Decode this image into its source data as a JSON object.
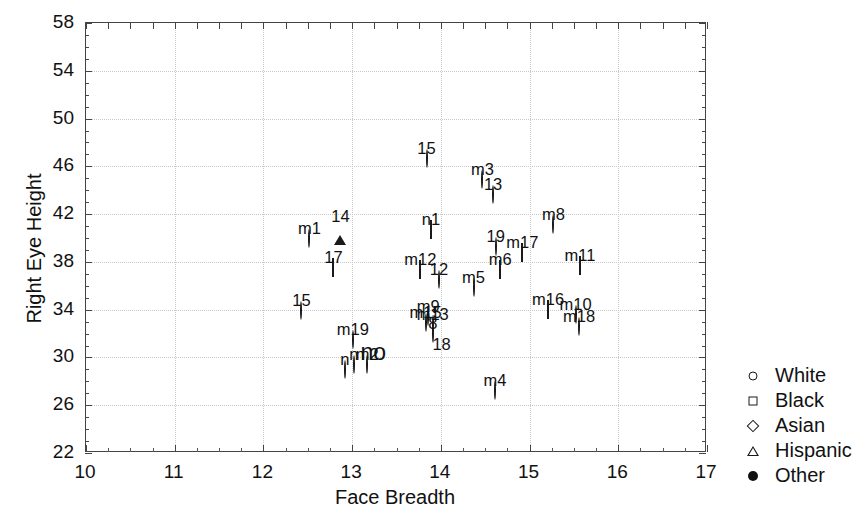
{
  "chart_data": {
    "type": "scatter",
    "title": "",
    "xlabel": "Face Breadth",
    "ylabel": "Right Eye Height",
    "xlim": [
      10,
      17
    ],
    "ylim": [
      22,
      58
    ],
    "xticks": [
      10,
      11,
      12,
      13,
      14,
      15,
      16,
      17
    ],
    "yticks": [
      22,
      26,
      30,
      34,
      38,
      42,
      46,
      50,
      54,
      58
    ],
    "grid": true,
    "legend_position": "right-outside",
    "legend": [
      {
        "label": "White",
        "marker": "open-circle"
      },
      {
        "label": "Black",
        "marker": "open-square"
      },
      {
        "label": "Asian",
        "marker": "open-diamond"
      },
      {
        "label": "Hispanic",
        "marker": "open-triangle"
      },
      {
        "label": "Other",
        "marker": "filled-circle"
      }
    ],
    "annotations": [
      {
        "text": "no",
        "x": 13.25,
        "y": 30.2
      }
    ],
    "points": [
      {
        "label": "15",
        "group": "White",
        "marker": "open-circle",
        "x": 13.85,
        "y": 46.5
      },
      {
        "label": "m3",
        "group": "White",
        "marker": "open-circle",
        "x": 14.48,
        "y": 44.8
      },
      {
        "label": "13",
        "group": "White",
        "marker": "open-circle",
        "x": 14.6,
        "y": 43.5
      },
      {
        "label": "m8",
        "group": "White",
        "marker": "open-circle",
        "x": 15.28,
        "y": 41.0
      },
      {
        "label": "14",
        "group": "Hispanic",
        "marker": "open-triangle",
        "x": 12.88,
        "y": 40.8
      },
      {
        "label": "n1",
        "group": "Asian",
        "marker": "open-diamond",
        "x": 13.9,
        "y": 40.6
      },
      {
        "label": "m1",
        "group": "White",
        "marker": "open-circle",
        "x": 12.53,
        "y": 39.8
      },
      {
        "label": "19",
        "group": "White",
        "marker": "open-circle",
        "x": 14.63,
        "y": 39.2
      },
      {
        "label": "m17",
        "group": "Black",
        "marker": "open-square",
        "x": 14.93,
        "y": 38.7
      },
      {
        "label": "m11",
        "group": "Black",
        "marker": "open-square",
        "x": 15.58,
        "y": 37.6
      },
      {
        "label": "17",
        "group": "Black",
        "marker": "open-square",
        "x": 12.8,
        "y": 37.4
      },
      {
        "label": "m6",
        "group": "Asian",
        "marker": "open-diamond",
        "x": 14.68,
        "y": 37.2
      },
      {
        "label": "m12",
        "group": "Black",
        "marker": "open-square",
        "x": 13.78,
        "y": 37.2
      },
      {
        "label": "12",
        "group": "White",
        "marker": "open-circle",
        "x": 13.99,
        "y": 36.4
      },
      {
        "label": "m5",
        "group": "White",
        "marker": "open-circle",
        "x": 14.38,
        "y": 35.7
      },
      {
        "label": "m16",
        "group": "Asian",
        "marker": "open-diamond",
        "x": 15.22,
        "y": 33.9
      },
      {
        "label": "15",
        "group": "White",
        "marker": "open-circle",
        "x": 12.44,
        "y": 33.8
      },
      {
        "label": "m10",
        "group": "White",
        "marker": "open-circle",
        "x": 15.53,
        "y": 33.5
      },
      {
        "label": "m9",
        "group": "White",
        "marker": "open-circle",
        "x": 13.87,
        "y": 33.3
      },
      {
        "label": "m15",
        "group": "White",
        "marker": "open-circle",
        "x": 13.84,
        "y": 32.8
      },
      {
        "label": "m13",
        "group": "White",
        "marker": "open-circle",
        "x": 13.92,
        "y": 32.6
      },
      {
        "label": "m18",
        "group": "White",
        "marker": "open-circle",
        "x": 15.57,
        "y": 32.5
      },
      {
        "label": "8",
        "group": "White",
        "marker": "open-circle",
        "x": 13.92,
        "y": 31.9
      },
      {
        "label": "m19",
        "group": "White",
        "marker": "open-circle",
        "x": 13.02,
        "y": 31.4
      },
      {
        "label": "18",
        "group": "Other",
        "marker": "filled-circle",
        "x": 14.02,
        "y": 30.1
      },
      {
        "label": "m2",
        "group": "White",
        "marker": "open-circle",
        "x": 13.18,
        "y": 29.3
      },
      {
        "label": "n",
        "group": "White",
        "marker": "open-circle",
        "x": 12.93,
        "y": 28.9
      },
      {
        "label": "n",
        "group": "White",
        "marker": "open-circle",
        "x": 13.03,
        "y": 29.3
      },
      {
        "label": "m4",
        "group": "White",
        "marker": "open-circle",
        "x": 14.62,
        "y": 27.1
      }
    ]
  }
}
